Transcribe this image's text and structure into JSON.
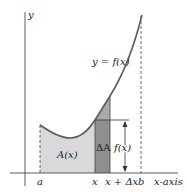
{
  "diagram": {
    "type": "area-under-curve",
    "colors": {
      "area_fill": "#d9d9d9",
      "strip_fill": "#8f8f8f",
      "cap_fill": "#a9a9a9",
      "curve": "#5a5a5a",
      "axis": "#333333"
    },
    "labels": {
      "y_axis": "y",
      "x_axis": "x-axis",
      "curve": "y = f(x)",
      "area": "A(x)",
      "delta_area": "ΔA",
      "height": "f(x)",
      "tick_a": "a",
      "tick_x": "x",
      "tick_x_dx": "x + Δx",
      "tick_b": "b"
    }
  }
}
